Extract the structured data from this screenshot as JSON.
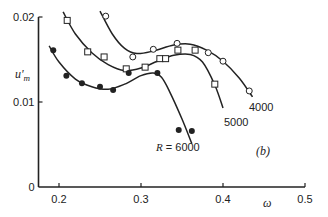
{
  "chart_data": {
    "type": "scatter",
    "title": "",
    "panel_label": "(b)",
    "xlabel": "ω",
    "ylabel": "u'm",
    "xlim": [
      0.175,
      0.5
    ],
    "ylim": [
      0,
      0.02
    ],
    "x_ticks": [
      0.2,
      0.3,
      0.4,
      0.5
    ],
    "x_tick_labels": [
      "0.2",
      "0.3",
      "0.4",
      "0.5"
    ],
    "y_ticks": [
      0,
      0.01,
      0.02
    ],
    "y_tick_labels": [
      "0",
      "0.01",
      "0.02"
    ],
    "grid": false,
    "legend": "inline curve labels",
    "series": [
      {
        "name": "R = 4000",
        "label": "4000",
        "marker": "open-circle",
        "points": [
          [
            0.257,
            0.0201
          ],
          [
            0.29,
            0.0153
          ],
          [
            0.315,
            0.0162
          ],
          [
            0.344,
            0.0169
          ],
          [
            0.382,
            0.0158
          ],
          [
            0.4,
            0.0148
          ],
          [
            0.432,
            0.0113
          ]
        ],
        "fit_curve": [
          [
            0.25,
            0.0207
          ],
          [
            0.265,
            0.018
          ],
          [
            0.28,
            0.0163
          ],
          [
            0.295,
            0.0157
          ],
          [
            0.315,
            0.016
          ],
          [
            0.34,
            0.0167
          ],
          [
            0.36,
            0.0168
          ],
          [
            0.38,
            0.0161
          ],
          [
            0.4,
            0.0148
          ],
          [
            0.42,
            0.0128
          ],
          [
            0.436,
            0.0106
          ]
        ]
      },
      {
        "name": "R = 5000",
        "label": "5000",
        "marker": "open-square",
        "points": [
          [
            0.21,
            0.0196
          ],
          [
            0.235,
            0.0159
          ],
          [
            0.255,
            0.0153
          ],
          [
            0.282,
            0.0139
          ],
          [
            0.305,
            0.0141
          ],
          [
            0.323,
            0.0151
          ],
          [
            0.33,
            0.0151
          ],
          [
            0.345,
            0.0161
          ],
          [
            0.366,
            0.0161
          ],
          [
            0.39,
            0.0121
          ]
        ],
        "fit_curve": [
          [
            0.205,
            0.0206
          ],
          [
            0.22,
            0.018
          ],
          [
            0.24,
            0.0158
          ],
          [
            0.26,
            0.0144
          ],
          [
            0.28,
            0.0137
          ],
          [
            0.3,
            0.014
          ],
          [
            0.32,
            0.0148
          ],
          [
            0.34,
            0.0155
          ],
          [
            0.36,
            0.0156
          ],
          [
            0.375,
            0.0147
          ],
          [
            0.39,
            0.012
          ],
          [
            0.4,
            0.0093
          ]
        ]
      },
      {
        "name": "R = 6000",
        "label": "R = 6000",
        "marker": "filled-circle",
        "points": [
          [
            0.193,
            0.0161
          ],
          [
            0.209,
            0.0131
          ],
          [
            0.228,
            0.0122
          ],
          [
            0.25,
            0.0118
          ],
          [
            0.266,
            0.0114
          ],
          [
            0.285,
            0.0134
          ],
          [
            0.32,
            0.0134
          ],
          [
            0.346,
            0.0067
          ],
          [
            0.362,
            0.0066
          ]
        ],
        "fit_curve": [
          [
            0.188,
            0.0166
          ],
          [
            0.2,
            0.0147
          ],
          [
            0.22,
            0.0127
          ],
          [
            0.24,
            0.0118
          ],
          [
            0.26,
            0.0115
          ],
          [
            0.28,
            0.0121
          ],
          [
            0.3,
            0.0131
          ],
          [
            0.315,
            0.0134
          ],
          [
            0.325,
            0.0129
          ],
          [
            0.335,
            0.0112
          ],
          [
            0.35,
            0.008
          ],
          [
            0.362,
            0.0051
          ]
        ]
      }
    ]
  },
  "labels": {
    "y_axis": "u'",
    "y_axis_sub": "m",
    "x_axis": "ω",
    "panel": "(b)",
    "curve_4000": "4000",
    "curve_5000": "5000",
    "curve_6000": "R = 6000"
  }
}
